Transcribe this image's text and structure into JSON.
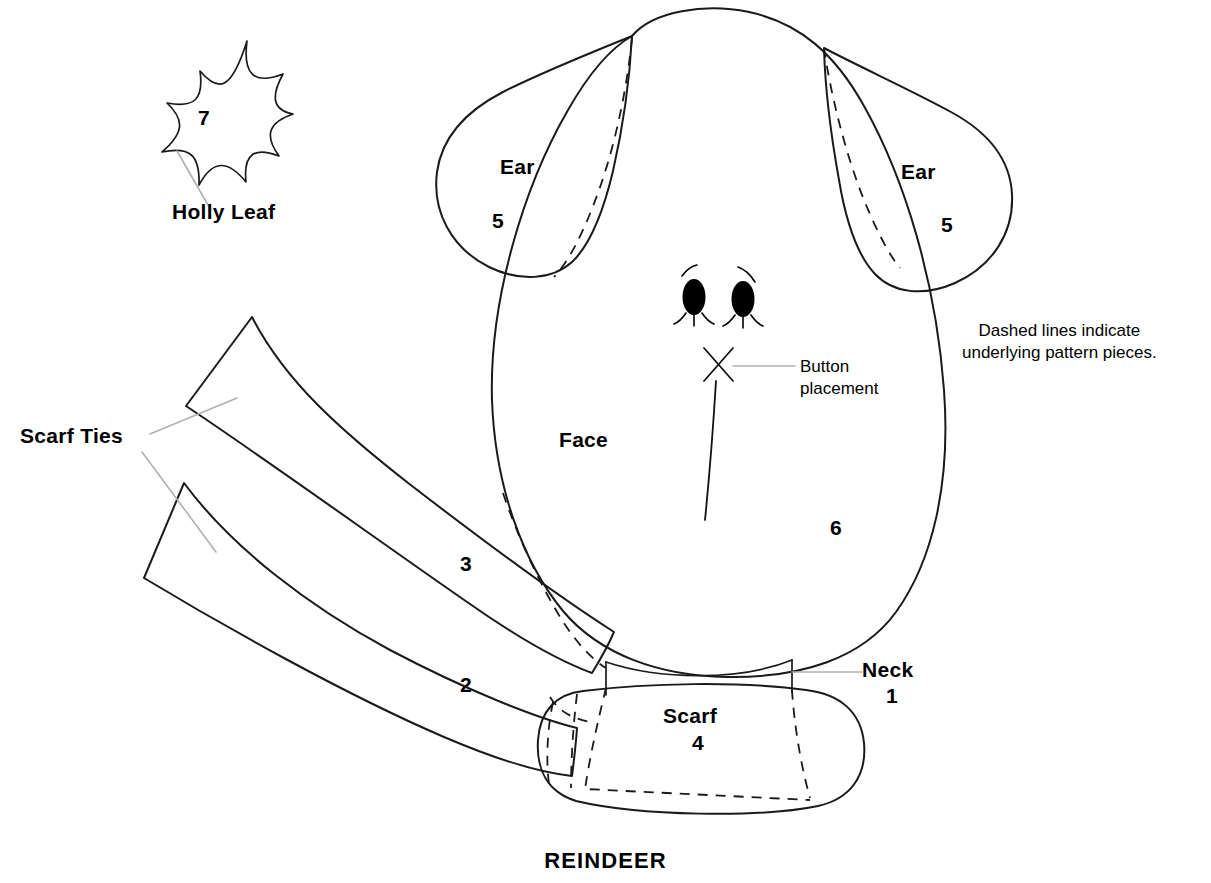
{
  "title": "REINDEER",
  "note": {
    "line1": "Dashed lines indicate",
    "line2": "underlying pattern pieces."
  },
  "callouts": {
    "button_line1": "Button",
    "button_line2": "placement"
  },
  "pieces": {
    "holly_leaf": {
      "label": "Holly Leaf",
      "number": "7"
    },
    "ear_left": {
      "label": "Ear",
      "number": "5"
    },
    "ear_right": {
      "label": "Ear",
      "number": "5"
    },
    "face": {
      "label": "Face",
      "number": "6"
    },
    "neck": {
      "label": "Neck",
      "number": "1"
    },
    "scarf": {
      "label": "Scarf",
      "number": "4"
    },
    "scarf_ties": {
      "label": "Scarf Ties",
      "number_upper": "3",
      "number_lower": "2"
    }
  },
  "colors": {
    "ink": "#1a1a1a",
    "leader": "#b0b0b0",
    "background": "#ffffff"
  },
  "icons": {
    "button_mark": "x-mark-icon",
    "eye_left": "eye-icon",
    "eye_right": "eye-icon"
  }
}
